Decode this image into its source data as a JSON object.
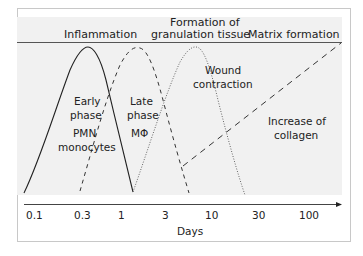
{
  "phases": {
    "inflammation": "Inflammation",
    "granulation_line1": "Formation of",
    "granulation_line2": "granulation tissue",
    "matrix": "Matrix formation"
  },
  "annotations": {
    "early_line1": "Early",
    "early_line2": "phase",
    "early_cells1": "PMN",
    "early_cells2": "monocytes",
    "late_line1": "Late",
    "late_line2": "phase",
    "late_cells": "MΦ",
    "wound_line1": "Wound",
    "wound_line2": "contraction",
    "collagen_line1": "Increase of",
    "collagen_line2": "collagen"
  },
  "axis": {
    "label": "Days",
    "ticks": [
      "0.1",
      "0.3",
      "1",
      "3",
      "10",
      "30",
      "100"
    ]
  },
  "curves": [
    {
      "name": "Early phase (PMN, monocytes)",
      "style": "solid"
    },
    {
      "name": "Late phase (MΦ)",
      "style": "dashed"
    },
    {
      "name": "Wound contraction",
      "style": "dotted"
    },
    {
      "name": "Increase of collagen",
      "style": "long-dashed line"
    }
  ],
  "colors": {
    "line": "#222222",
    "plot_background": "#f1f1f1",
    "frame": "#c8c8c8"
  }
}
